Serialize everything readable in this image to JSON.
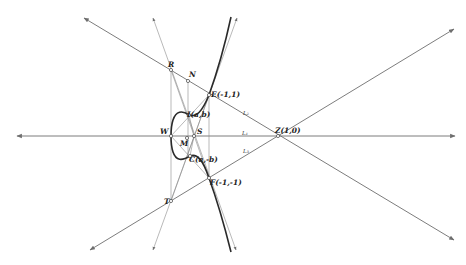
{
  "diagram": {
    "width": 466,
    "height": 265,
    "colors": {
      "line": "#6e6e6e",
      "curve": "#2a2a2a",
      "background": "#ffffff"
    },
    "points": [
      {
        "id": "W",
        "label": "W",
        "x": 171,
        "y": 136,
        "lx": 160,
        "ly": 134
      },
      {
        "id": "S",
        "label": "S",
        "x": 194,
        "y": 136,
        "lx": 197,
        "ly": 134
      },
      {
        "id": "M",
        "label": "M",
        "x": 187,
        "y": 138,
        "lx": 180,
        "ly": 146
      },
      {
        "id": "Z",
        "label": "Z(1,0)",
        "x": 278,
        "y": 136,
        "lx": 275,
        "ly": 133
      },
      {
        "id": "R",
        "label": "R",
        "x": 171,
        "y": 70,
        "lx": 168,
        "ly": 67
      },
      {
        "id": "N",
        "label": "N",
        "x": 188,
        "y": 81,
        "lx": 189,
        "ly": 77
      },
      {
        "id": "E",
        "label": "E(-1,1)",
        "x": 209,
        "y": 95,
        "lx": 211,
        "ly": 97
      },
      {
        "id": "F",
        "label": "F(-1,-1)",
        "x": 209,
        "y": 178,
        "lx": 210,
        "ly": 185
      },
      {
        "id": "T",
        "label": "T",
        "x": 171,
        "y": 201,
        "lx": 164,
        "ly": 204
      },
      {
        "id": "I",
        "label": "I(a,b)",
        "x": 189,
        "y": 115,
        "lx": 187,
        "ly": 117
      },
      {
        "id": "C",
        "label": "C(a,-b)",
        "x": 190,
        "y": 156,
        "lx": 189,
        "ly": 162
      }
    ],
    "line_labels": [
      {
        "label": "L₂",
        "x": 243,
        "y": 115
      },
      {
        "label": "L₁",
        "x": 242,
        "y": 135
      },
      {
        "label": "L₃",
        "x": 243,
        "y": 153
      }
    ],
    "arrow_lines": [
      {
        "name": "x-axis-line",
        "x1": 17,
        "y1": 136,
        "x2": 455,
        "y2": 136,
        "style": "ln",
        "both": true
      },
      {
        "name": "line-L2",
        "x1": 84,
        "y1": 18,
        "x2": 454,
        "y2": 240,
        "style": "ln",
        "both": true
      },
      {
        "name": "line-L3",
        "x1": 90,
        "y1": 250,
        "x2": 454,
        "y2": 29,
        "style": "ln",
        "both": true
      },
      {
        "name": "line-through-W-left",
        "x1": 153,
        "y1": 18,
        "x2": 236,
        "y2": 250,
        "style": "ln-thin",
        "both": true
      },
      {
        "name": "line-through-W-right",
        "x1": 237,
        "y1": 18,
        "x2": 153,
        "y2": 250,
        "style": "ln-thin",
        "both": true
      }
    ],
    "segments": [
      {
        "name": "vertical-R-T",
        "x1": 171,
        "y1": 70,
        "x2": 171,
        "y2": 201
      },
      {
        "name": "vertical-N",
        "x1": 188,
        "y1": 81,
        "x2": 188,
        "y2": 158
      },
      {
        "name": "vertical-E-F",
        "x1": 209,
        "y1": 95,
        "x2": 209,
        "y2": 178
      },
      {
        "name": "segment-W-E",
        "x1": 171,
        "y1": 136,
        "x2": 209,
        "y2": 95
      },
      {
        "name": "segment-W-F",
        "x1": 171,
        "y1": 136,
        "x2": 209,
        "y2": 178
      },
      {
        "name": "segment-I-S",
        "x1": 189,
        "y1": 115,
        "x2": 194,
        "y2": 136
      },
      {
        "name": "segment-C-S",
        "x1": 190,
        "y1": 156,
        "x2": 194,
        "y2": 136
      },
      {
        "name": "segment-R-C",
        "x1": 171,
        "y1": 70,
        "x2": 209,
        "y2": 178
      },
      {
        "name": "segment-T-I",
        "x1": 171,
        "y1": 201,
        "x2": 209,
        "y2": 95
      }
    ],
    "curve_path": "M231,17 C226,40 218,70 209,95 C202,112 196,118 189,115 C182,110 176,111 173,120 C171,126 171,132 171,136 C171,140 171,146 173,152 C176,161 182,161 190,156 C197,153 203,160 209,178 C217,200 225,228 231,252"
  }
}
